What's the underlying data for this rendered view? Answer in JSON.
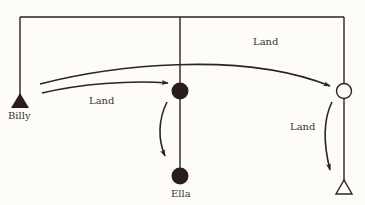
{
  "diagram": {
    "type": "genogram-inheritance",
    "colors": {
      "background": "#fdfcf6",
      "ink": "#2a2424",
      "node_fill": "#2a1c1e"
    },
    "nodes": [
      {
        "id": "billy",
        "shape": "filled-triangle",
        "label": "Billy"
      },
      {
        "id": "ella_parent",
        "shape": "filled-circle",
        "label": ""
      },
      {
        "id": "ella",
        "shape": "filled-circle",
        "label": "Ella"
      },
      {
        "id": "right_parent",
        "shape": "open-circle",
        "label": ""
      },
      {
        "id": "right_child",
        "shape": "open-triangle",
        "label": ""
      }
    ],
    "edges": [
      {
        "from": "billy",
        "to": "ella_parent",
        "label": "Land"
      },
      {
        "from": "billy",
        "to": "right_parent",
        "label": "Land"
      },
      {
        "from": "ella_parent",
        "to": "ella",
        "label": ""
      },
      {
        "from": "right_parent",
        "to": "right_child",
        "label": "Land"
      }
    ],
    "labels": {
      "billy": "Billy",
      "ella": "Ella",
      "land_top": "Land",
      "land_left": "Land",
      "land_right": "Land"
    }
  }
}
